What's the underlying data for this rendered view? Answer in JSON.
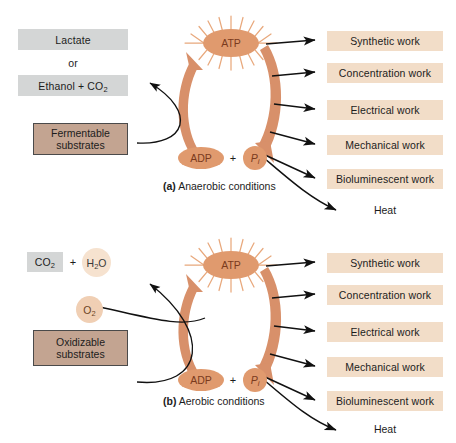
{
  "figure": {
    "colors": {
      "molecule_orange": "#e09a6e",
      "cycle_arrow_orange": "#d8906a",
      "sunburst_ray": "#e8a87c",
      "product_gray": "#d4d6d6",
      "substrate_tan": "#c3a491",
      "work_box_peach": "#f2ddc8",
      "o2_circle": "#f0cfb4",
      "h2o_circle": "#f6e2cf",
      "arrow_black": "#111111",
      "text": "#1c1c1c"
    }
  },
  "panels": [
    {
      "id": "a",
      "caption_marker": "(a)",
      "caption_text": "Anaerobic conditions",
      "inputs": {
        "substrate_line1": "Fermentable",
        "substrate_line2": "substrates"
      },
      "products": {
        "first": "Lactate",
        "conjunction": "or",
        "second_text": "Ethanol + CO",
        "second_sub": "2"
      },
      "cycle": {
        "top_molecule": "ATP",
        "bottom_left_molecule": "ADP",
        "plus": "+",
        "bottom_right_molecule": "P",
        "bottom_right_subscript": "i"
      },
      "outputs": [
        "Synthetic work",
        "Concentration work",
        "Electrical work",
        "Mechanical work",
        "Bioluminescent work"
      ],
      "heat_label": "Heat"
    },
    {
      "id": "b",
      "caption_marker": "(b)",
      "caption_text": "Aerobic conditions",
      "inputs": {
        "substrate_line1": "Oxidizable",
        "substrate_line2": "substrates",
        "oxygen_text": "O",
        "oxygen_sub": "2"
      },
      "products": {
        "co2_text": "CO",
        "co2_sub": "2",
        "plus": "+",
        "h2o_text": "H",
        "h2o_sub": "2",
        "h2o_tail": "O"
      },
      "cycle": {
        "top_molecule": "ATP",
        "bottom_left_molecule": "ADP",
        "plus": "+",
        "bottom_right_molecule": "P",
        "bottom_right_subscript": "i"
      },
      "outputs": [
        "Synthetic work",
        "Concentration work",
        "Electrical work",
        "Mechanical work",
        "Bioluminescent work"
      ],
      "heat_label": "Heat"
    }
  ]
}
